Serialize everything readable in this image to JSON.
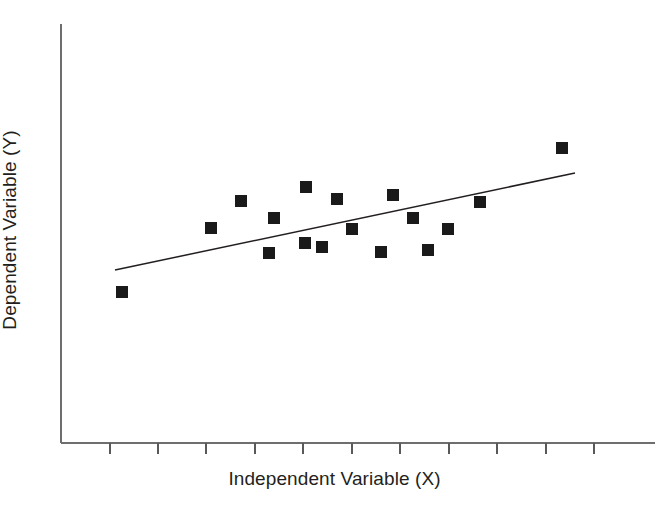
{
  "figure": {
    "width": 669,
    "height": 519,
    "background": "#ffffff",
    "ink_color": "#231f20",
    "axis_color": "#6d6e70",
    "marker_color": "#1a1a1a"
  },
  "axes": {
    "x_title": "Independent Variable (X)",
    "y_title": "Dependent Variable (Y)",
    "x_axis_y_px": 443,
    "y_axis_x_px": 61,
    "y_axis_top_px": 24,
    "x_axis_right_px": 655,
    "tick_length_px": 11,
    "tick_count": 11,
    "tick_positions_px": [
      110,
      158,
      206,
      255,
      303,
      352,
      400,
      449,
      497,
      546,
      594
    ]
  },
  "chart_data": {
    "type": "scatter",
    "title": "",
    "xlabel": "Independent Variable (X)",
    "ylabel": "Dependent Variable (Y)",
    "xlim": [
      0,
      10
    ],
    "ylim": [
      0,
      10
    ],
    "grid": false,
    "legend": null,
    "x_tick_labels": [],
    "y_tick_labels": [],
    "marker_style": "filled-square",
    "marker_size_px": 12,
    "points_px": [
      {
        "x": 122,
        "y": 292
      },
      {
        "x": 211,
        "y": 228
      },
      {
        "x": 241,
        "y": 201
      },
      {
        "x": 269,
        "y": 253
      },
      {
        "x": 274,
        "y": 218
      },
      {
        "x": 305,
        "y": 243
      },
      {
        "x": 306,
        "y": 187
      },
      {
        "x": 322,
        "y": 247
      },
      {
        "x": 337,
        "y": 199
      },
      {
        "x": 352,
        "y": 229
      },
      {
        "x": 381,
        "y": 252
      },
      {
        "x": 393,
        "y": 195
      },
      {
        "x": 413,
        "y": 218
      },
      {
        "x": 428,
        "y": 250
      },
      {
        "x": 448,
        "y": 229
      },
      {
        "x": 480,
        "y": 202
      },
      {
        "x": 562,
        "y": 148
      }
    ],
    "points": [
      {
        "x": 0.6,
        "y": 3.6
      },
      {
        "x": 2.5,
        "y": 5.1
      },
      {
        "x": 3.1,
        "y": 5.8
      },
      {
        "x": 3.7,
        "y": 4.6
      },
      {
        "x": 3.8,
        "y": 5.4
      },
      {
        "x": 4.5,
        "y": 4.8
      },
      {
        "x": 4.5,
        "y": 6.2
      },
      {
        "x": 4.8,
        "y": 4.7
      },
      {
        "x": 5.1,
        "y": 5.9
      },
      {
        "x": 5.5,
        "y": 5.1
      },
      {
        "x": 6.1,
        "y": 4.6
      },
      {
        "x": 6.3,
        "y": 6.0
      },
      {
        "x": 6.7,
        "y": 5.4
      },
      {
        "x": 7.0,
        "y": 4.7
      },
      {
        "x": 7.4,
        "y": 5.1
      },
      {
        "x": 8.0,
        "y": 5.7
      },
      {
        "x": 9.7,
        "y": 7.0
      }
    ],
    "trendline": {
      "type": "linear-fit",
      "x1_px": 115,
      "y1_px": 270,
      "x2_px": 575,
      "y2_px": 173,
      "slope_sign": "positive",
      "description": "positive linear trend line"
    }
  }
}
